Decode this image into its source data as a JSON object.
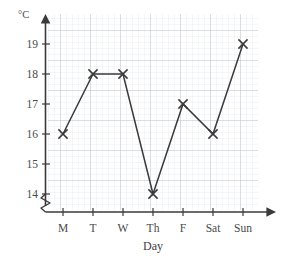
{
  "chart_data": {
    "type": "line",
    "title": "",
    "xlabel": "Day",
    "ylabel": "°C",
    "categories": [
      "M",
      "T",
      "W",
      "Th",
      "F",
      "Sat",
      "Sun"
    ],
    "values": [
      16,
      18,
      18,
      14,
      17,
      16,
      19
    ],
    "series": [
      {
        "name": "Temperature",
        "values": [
          16,
          18,
          18,
          14,
          17,
          16,
          19
        ]
      }
    ],
    "ytick_labels": [
      "14",
      "15",
      "16",
      "17",
      "18",
      "19"
    ],
    "ytick_values": [
      14,
      15,
      16,
      17,
      18,
      19
    ],
    "ylim": [
      14,
      19.6
    ],
    "axis_break": true,
    "axis_break_symbol": "zigzag",
    "grid": true,
    "grid_style": "graph-paper",
    "minor_grid_per_cell": 5,
    "legend": "none",
    "marker": "cross",
    "line_color": "#3a3a3a",
    "marker_color": "#3a3a3a",
    "major_grid_color": "#b9bec7",
    "minor_grid_color": "#e2e6ee",
    "axis_color": "#3a3a3a",
    "background_color": "#ffffff",
    "points": [
      {
        "category": "M",
        "value": 16
      },
      {
        "category": "T",
        "value": 18
      },
      {
        "category": "W",
        "value": 18
      },
      {
        "category": "Th",
        "value": 14
      },
      {
        "category": "F",
        "value": 17
      },
      {
        "category": "Sat",
        "value": 16
      },
      {
        "category": "Sun",
        "value": 19
      }
    ]
  },
  "axes": {
    "y_unit": "°C",
    "x_title": "Day"
  },
  "ticks": {
    "y": [
      "19",
      "18",
      "17",
      "16",
      "15",
      "14"
    ],
    "x": [
      "M",
      "T",
      "W",
      "Th",
      "F",
      "Sat",
      "Sun"
    ]
  }
}
